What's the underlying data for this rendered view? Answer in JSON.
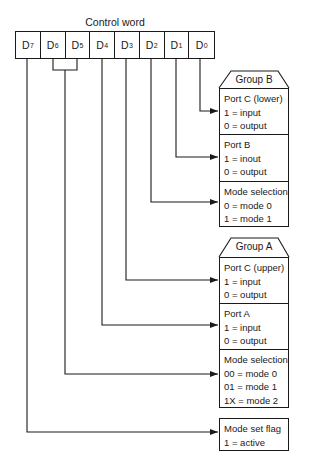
{
  "title": "Control word",
  "bits": [
    {
      "label": "D",
      "sub": "7"
    },
    {
      "label": "D",
      "sub": "6"
    },
    {
      "label": "D",
      "sub": "5"
    },
    {
      "label": "D",
      "sub": "4"
    },
    {
      "label": "D",
      "sub": "3"
    },
    {
      "label": "D",
      "sub": "2"
    },
    {
      "label": "D",
      "sub": "1"
    },
    {
      "label": "D",
      "sub": "0"
    }
  ],
  "group_b": {
    "header": "Group B",
    "sections": [
      {
        "title": "Port C (lower)",
        "lines": [
          "1 = input",
          "0 = output"
        ],
        "bit": "D0"
      },
      {
        "title": "Port B",
        "lines": [
          "1 = inout",
          "0 = output"
        ],
        "bit": "D1"
      },
      {
        "title": "Mode selection",
        "lines": [
          "0 = mode 0",
          "1 = mode 1"
        ],
        "bit": "D2"
      }
    ]
  },
  "group_a": {
    "header": "Group A",
    "sections": [
      {
        "title": "Port C (upper)",
        "lines": [
          "1 = input",
          "0 = output"
        ],
        "bit": "D3"
      },
      {
        "title": "Port A",
        "lines": [
          "1 = input",
          "0 = output"
        ],
        "bit": "D4"
      },
      {
        "title": "Mode selection",
        "lines": [
          "00 = mode 0",
          "01 = mode 1",
          "1X = mode 2"
        ],
        "bit": "D6-D5"
      }
    ]
  },
  "mode_flag": {
    "title": "Mode set flag",
    "lines": [
      "1 = active"
    ],
    "bit": "D7"
  }
}
